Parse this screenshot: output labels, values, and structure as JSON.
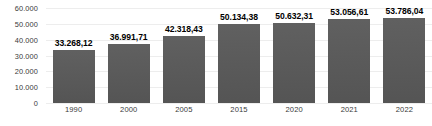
{
  "chart_data": {
    "type": "bar",
    "title": "",
    "subtitle": "",
    "xlabel": "",
    "ylabel": "",
    "categories": [
      "1990",
      "2000",
      "2005",
      "2015",
      "2020",
      "2021",
      "2022"
    ],
    "values": [
      33268.12,
      36991.71,
      42318.43,
      50134.38,
      50632.31,
      53056.61,
      53786.04
    ],
    "value_labels": [
      "33.268,12",
      "36.991,71",
      "42.318,43",
      "50.134,38",
      "50.632,31",
      "53.056,61",
      "53.786,04"
    ],
    "ylim": [
      0,
      60000
    ],
    "ytick_values": [
      60000,
      50000,
      40000,
      30000,
      20000,
      10000,
      0
    ],
    "ytick_labels": [
      "60.000",
      "50.000",
      "40.000",
      "30.000",
      "20.000",
      "10.000",
      "0"
    ],
    "grid": true,
    "legend": false,
    "legend_position": "none",
    "bar_color": "#595959",
    "grid_color": "#ededed",
    "label_color": "#000000",
    "tick_color": "#3a3a3a",
    "background_color": "#ffffff",
    "number_format": "european"
  }
}
